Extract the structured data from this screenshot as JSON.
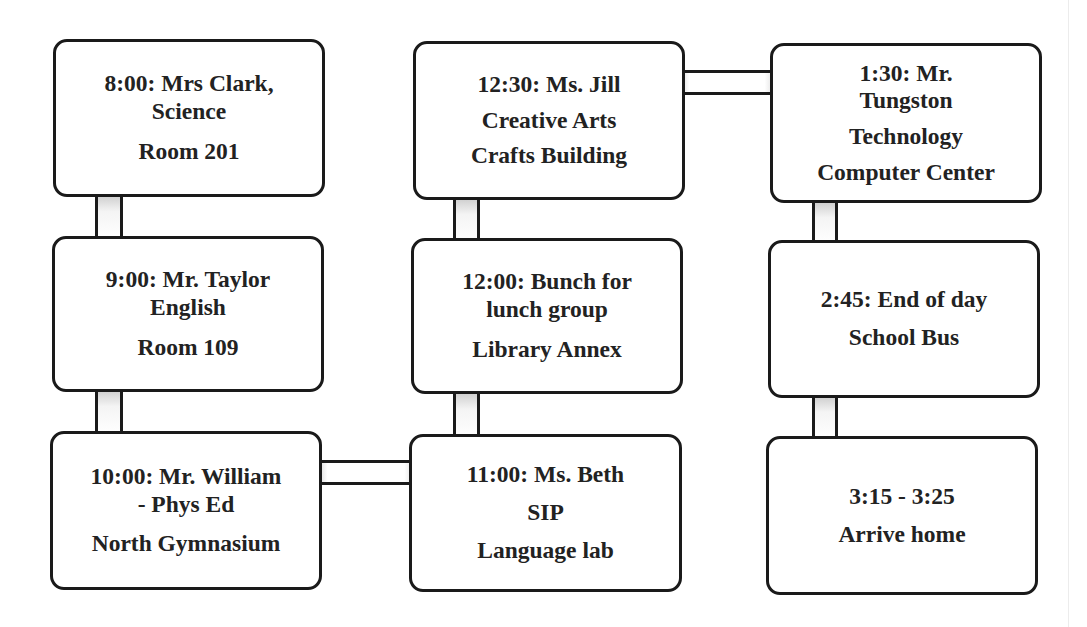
{
  "diagram": {
    "type": "schedule-flow",
    "boxes": [
      {
        "id": "b1",
        "lines": [
          "8:00: Mrs Clark,",
          "Science",
          "Room 201"
        ]
      },
      {
        "id": "b2",
        "lines": [
          "9:00: Mr. Taylor",
          "English",
          "Room 109"
        ]
      },
      {
        "id": "b3",
        "lines": [
          "10:00: Mr. William",
          "- Phys Ed",
          "North Gymnasium"
        ]
      },
      {
        "id": "b4",
        "lines": [
          "11:00: Ms. Beth",
          "SIP",
          "Language lab"
        ]
      },
      {
        "id": "b5",
        "lines": [
          "12:00: Bunch for",
          "lunch group",
          "Library Annex"
        ]
      },
      {
        "id": "b6",
        "lines": [
          "12:30: Ms. Jill",
          "Creative Arts",
          "Crafts Building"
        ]
      },
      {
        "id": "b7",
        "lines": [
          "1:30: Mr.",
          "Tungston",
          "Technology",
          "Computer Center"
        ]
      },
      {
        "id": "b8",
        "lines": [
          "2:45: End of day",
          "School Bus"
        ]
      },
      {
        "id": "b9",
        "lines": [
          "3:15 - 3:25",
          "Arrive home"
        ]
      }
    ],
    "connections": [
      [
        "b1",
        "b2"
      ],
      [
        "b2",
        "b3"
      ],
      [
        "b3",
        "b4"
      ],
      [
        "b4",
        "b5"
      ],
      [
        "b5",
        "b6"
      ],
      [
        "b6",
        "b7"
      ],
      [
        "b7",
        "b8"
      ],
      [
        "b8",
        "b9"
      ]
    ]
  }
}
